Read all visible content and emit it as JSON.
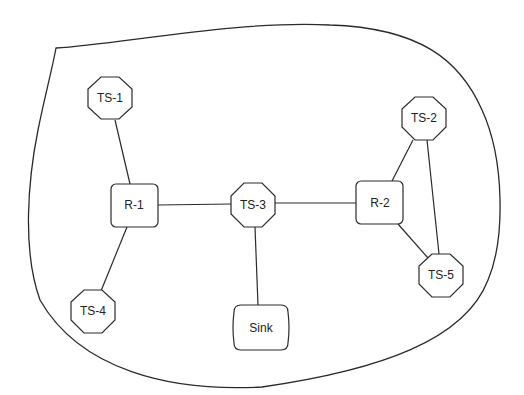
{
  "diagram": {
    "type": "network-topology",
    "region": "sensor-field-boundary",
    "nodes": [
      {
        "id": "TS-1",
        "label": "TS-1",
        "shape": "octagon",
        "cx": 110,
        "cy": 98
      },
      {
        "id": "TS-2",
        "label": "TS-2",
        "shape": "octagon",
        "cx": 424,
        "cy": 118
      },
      {
        "id": "TS-3",
        "label": "TS-3",
        "shape": "octagon",
        "cx": 253,
        "cy": 205
      },
      {
        "id": "TS-4",
        "label": "TS-4",
        "shape": "octagon",
        "cx": 93,
        "cy": 311
      },
      {
        "id": "TS-5",
        "label": "TS-5",
        "shape": "octagon",
        "cx": 441,
        "cy": 275
      },
      {
        "id": "R-1",
        "label": "R-1",
        "shape": "rounded-rect",
        "cx": 134,
        "cy": 205
      },
      {
        "id": "R-2",
        "label": "R-2",
        "shape": "rounded-rect",
        "cx": 380,
        "cy": 203
      },
      {
        "id": "Sink",
        "label": "Sink",
        "shape": "barrel",
        "cx": 261,
        "cy": 328
      }
    ],
    "edges": [
      {
        "from": "TS-1",
        "to": "R-1"
      },
      {
        "from": "R-1",
        "to": "TS-4"
      },
      {
        "from": "R-1",
        "to": "TS-3"
      },
      {
        "from": "TS-3",
        "to": "R-2"
      },
      {
        "from": "TS-3",
        "to": "Sink"
      },
      {
        "from": "R-2",
        "to": "TS-2"
      },
      {
        "from": "R-2",
        "to": "TS-5"
      },
      {
        "from": "TS-2",
        "to": "TS-5"
      }
    ]
  }
}
